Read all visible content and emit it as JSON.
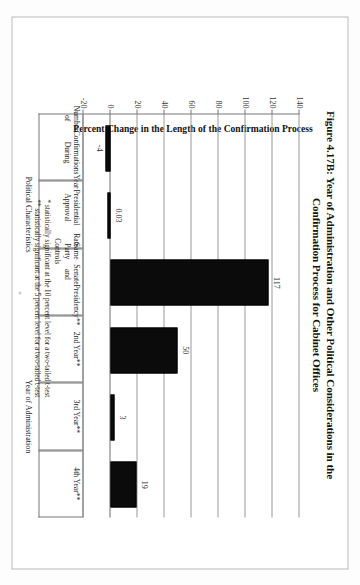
{
  "document": {
    "title": "Figure 4.17B: Year of Administration and Other Political Considerations in the Confirmation Process for Cabinet Offices",
    "title_line1": "Figure 4.17B: Year of Administration and Other Political Considerations in the",
    "title_line2": "Confirmation Process for Cabinet Offices"
  },
  "footnotes": [
    "* statistically significant at the 10 percent level for a two-tailed t-test",
    "** statistically significant at the 5 percent level for a two-tailed t-test"
  ],
  "groups": [
    {
      "label": "Political Characteristics",
      "start": 0,
      "end": 2
    },
    {
      "label": "Year of Administration",
      "start": 3,
      "end": 5
    }
  ],
  "chart_data": {
    "type": "bar",
    "title": "Figure 4.17B: Year of Administration and Other Political Considerations in the Confirmation Process for Cabinet Offices",
    "xlabel": "",
    "ylabel": "Percent Change in the Length of the Confirmation Process",
    "ylim": [
      -20,
      140
    ],
    "yticks": [
      140,
      120,
      100,
      80,
      60,
      40,
      20,
      0,
      -20
    ],
    "ytick_labels": [
      "140",
      "120",
      "100",
      "80",
      "60",
      "40",
      "20",
      "0",
      "-20"
    ],
    "grid": true,
    "legend": "none",
    "bar_color": "#0b0b0b",
    "categories": [
      "Number of Confirmations During Year",
      "Presidential Approval Rate",
      "Same Party Controls Senate and Presidency**",
      "2nd Year**",
      "3rd Year**",
      "4th Year**"
    ],
    "category_lines": [
      [
        "Number of",
        "Confirmations During",
        "Year"
      ],
      [
        "Presidential Approval",
        "Rate"
      ],
      [
        "Same Party Controls",
        "Senate and",
        "Presidency**"
      ],
      [
        "2nd Year**"
      ],
      [
        "3rd Year**"
      ],
      [
        "4th Year**"
      ]
    ],
    "values": [
      -4,
      0.03,
      117,
      50,
      3,
      19
    ],
    "value_labels": [
      "-4",
      "0.03",
      "117",
      "50",
      "3",
      "19"
    ]
  }
}
